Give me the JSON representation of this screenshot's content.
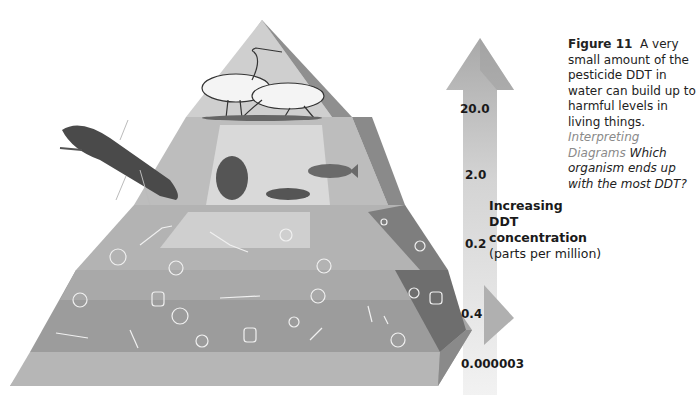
{
  "caption": {
    "figure_label": "Figure 11",
    "text": "A very small amount of the pesticide DDT in water can build up to harmful levels in living things.",
    "interpreting_label": "Interpreting Diagrams",
    "question": "Which organism ends up with the most DDT?"
  },
  "arrow": {
    "title_line1": "Increasing",
    "title_line2": "DDT",
    "title_line3": "concentration",
    "units": "(parts per million)"
  },
  "levels": [
    {
      "name": "fish-eating birds",
      "ddt_ppm": "20.0"
    },
    {
      "name": "large fish",
      "ddt_ppm": "2.0"
    },
    {
      "name": "small fish / zooplankton",
      "ddt_ppm": "0.2"
    },
    {
      "name": "producers (algae / plankton)",
      "ddt_ppm": "0.4"
    },
    {
      "name": "water",
      "ddt_ppm": "0.000003"
    }
  ],
  "organisms": {
    "top": "egrets / herons",
    "second": [
      "merganser diving bird",
      "sunfish",
      "minnow",
      "tadpole"
    ],
    "third": [
      "zooplankton",
      "copepods",
      "protozoa"
    ],
    "fourth": [
      "algae",
      "diatoms",
      "bacteria chains"
    ]
  },
  "colors": {
    "background": "#ffffff",
    "pyramid_light": "#d6d6d6",
    "pyramid_mid": "#a8a8a8",
    "pyramid_dark": "#7a7a7a",
    "arrow": "#c8c8c8",
    "text": "#1a1a1a",
    "interp_gray": "#8a8a8a"
  }
}
